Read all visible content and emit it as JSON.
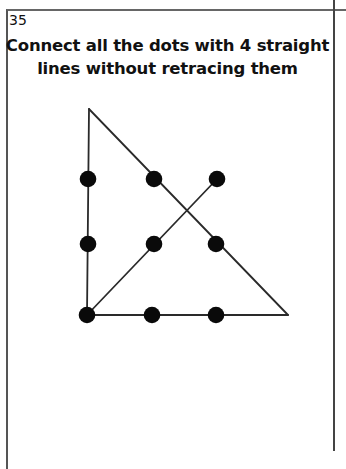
{
  "puzzle": {
    "number": "35",
    "title_lines": [
      "Connect all the dots with 4 straight",
      "lines without retracing them"
    ]
  },
  "colors": {
    "dot": "#0a0a0a",
    "line": "#2a2a2a",
    "border": "#555555",
    "background": "#ffffff"
  },
  "dots": [
    {
      "row": 1,
      "col": 1,
      "x": 88,
      "y": 179
    },
    {
      "row": 1,
      "col": 2,
      "x": 154,
      "y": 179
    },
    {
      "row": 1,
      "col": 3,
      "x": 217,
      "y": 179
    },
    {
      "row": 2,
      "col": 1,
      "x": 88,
      "y": 244
    },
    {
      "row": 2,
      "col": 2,
      "x": 154,
      "y": 244
    },
    {
      "row": 2,
      "col": 3,
      "x": 216,
      "y": 244
    },
    {
      "row": 3,
      "col": 1,
      "x": 87,
      "y": 315
    },
    {
      "row": 3,
      "col": 2,
      "x": 152,
      "y": 315
    },
    {
      "row": 3,
      "col": 3,
      "x": 216,
      "y": 315
    }
  ],
  "solution_lines": [
    {
      "id": "line-1-vertical",
      "x1": 89,
      "y1": 109,
      "x2": 87,
      "y2": 315
    },
    {
      "id": "line-2-diagonal-down",
      "x1": 89,
      "y1": 109,
      "x2": 288,
      "y2": 315
    },
    {
      "id": "line-3-horizontal",
      "x1": 87,
      "y1": 315,
      "x2": 288,
      "y2": 315
    },
    {
      "id": "line-4-diagonal-up",
      "x1": 87,
      "y1": 315,
      "x2": 217,
      "y2": 179
    }
  ]
}
